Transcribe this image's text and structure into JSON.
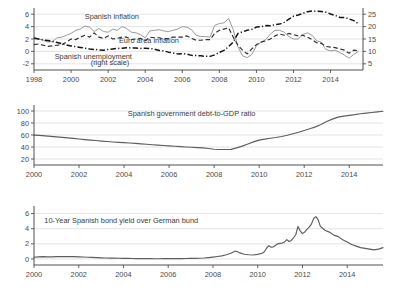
{
  "figure": {
    "title": "",
    "panel_count": 3
  },
  "chart_data": [
    {
      "id": "panel-inflation-unemployment",
      "type": "line",
      "title": "",
      "xlabel": "",
      "ylabel": "",
      "xlim": [
        1998.0,
        2015.75
      ],
      "xticks": [
        1998,
        2000,
        2002,
        2004,
        2006,
        2008,
        2010,
        2012,
        2014
      ],
      "xticklabels": [
        "1998",
        "2000",
        "2002",
        "2004",
        "2006",
        "2008",
        "2010",
        "2012",
        "2014"
      ],
      "ylim": [
        -3.0,
        7.0
      ],
      "yticks": [
        -2,
        0,
        2,
        4,
        6
      ],
      "yticklabels": [
        "-2",
        "0",
        "2",
        "4",
        "6"
      ],
      "y2lim": [
        2.5,
        27.5
      ],
      "y2ticks": [
        5,
        10,
        15,
        20,
        25
      ],
      "y2ticklabels": [
        "5",
        "10",
        "15",
        "20",
        "25"
      ],
      "grid": true,
      "legend_position": "inline-annotations",
      "annotations": [
        {
          "text": "Spanish inflation",
          "x": 2002.2,
          "y": 5.2,
          "color": "#a9a9a9"
        },
        {
          "text": "Euro area inflation",
          "x": 2004.2,
          "y": 1.35,
          "color": "#2b2b2b"
        },
        {
          "text": "Spanish unemployment",
          "x": 2001.2,
          "y": -1.25,
          "color": "#2b2b2b"
        },
        {
          "text": "(right scale)",
          "x": 2002.1,
          "y": -2.15,
          "color": "#2b2b2b"
        }
      ],
      "series": [
        {
          "name": "Spanish inflation",
          "axis": "left",
          "style": "solid-light",
          "color": "#9a9a9a",
          "x": [
            1998.0,
            1998.25,
            1998.5,
            1998.75,
            1999.0,
            1999.25,
            1999.5,
            1999.75,
            2000.0,
            2000.25,
            2000.5,
            2000.75,
            2001.0,
            2001.25,
            2001.5,
            2001.75,
            2002.0,
            2002.25,
            2002.5,
            2002.75,
            2003.0,
            2003.25,
            2003.5,
            2003.75,
            2004.0,
            2004.25,
            2004.5,
            2004.75,
            2005.0,
            2005.25,
            2005.5,
            2005.75,
            2006.0,
            2006.25,
            2006.5,
            2006.75,
            2007.0,
            2007.25,
            2007.5,
            2007.75,
            2008.0,
            2008.25,
            2008.5,
            2008.75,
            2009.0,
            2009.25,
            2009.5,
            2009.75,
            2010.0,
            2010.25,
            2010.5,
            2010.75,
            2011.0,
            2011.25,
            2011.5,
            2011.75,
            2012.0,
            2012.25,
            2012.5,
            2012.75,
            2013.0,
            2013.25,
            2013.5,
            2013.75,
            2014.0,
            2014.25,
            2014.5,
            2014.75,
            2015.0,
            2015.25,
            2015.5
          ],
          "values": [
            2.3,
            2.0,
            1.8,
            1.5,
            1.6,
            2.2,
            2.3,
            2.6,
            2.9,
            3.4,
            3.6,
            4.1,
            3.9,
            3.2,
            3.7,
            3.2,
            3.1,
            3.6,
            3.4,
            4.0,
            3.7,
            3.1,
            3.0,
            2.7,
            2.2,
            3.3,
            3.4,
            3.5,
            3.3,
            3.2,
            3.4,
            3.6,
            4.0,
            3.9,
            3.5,
            2.6,
            2.4,
            2.4,
            2.3,
            4.2,
            4.5,
            4.6,
            5.3,
            3.5,
            0.8,
            -0.7,
            -1.0,
            -0.5,
            0.9,
            1.5,
            1.9,
            2.8,
            3.4,
            3.4,
            3.1,
            2.4,
            2.0,
            2.0,
            2.7,
            3.0,
            2.6,
            1.7,
            1.5,
            0.3,
            0.1,
            0.2,
            -0.2,
            -0.6,
            -1.1,
            -0.5,
            0.0
          ]
        },
        {
          "name": "Euro area inflation",
          "axis": "left",
          "style": "dashed",
          "color": "#2f2f2f",
          "x": [
            1998.0,
            1998.25,
            1998.5,
            1998.75,
            1999.0,
            1999.25,
            1999.5,
            1999.75,
            2000.0,
            2000.25,
            2000.5,
            2000.75,
            2001.0,
            2001.25,
            2001.5,
            2001.75,
            2002.0,
            2002.25,
            2002.5,
            2002.75,
            2003.0,
            2003.25,
            2003.5,
            2003.75,
            2004.0,
            2004.25,
            2004.5,
            2004.75,
            2005.0,
            2005.25,
            2005.5,
            2005.75,
            2006.0,
            2006.25,
            2006.5,
            2006.75,
            2007.0,
            2007.25,
            2007.5,
            2007.75,
            2008.0,
            2008.25,
            2008.5,
            2008.75,
            2009.0,
            2009.25,
            2009.5,
            2009.75,
            2010.0,
            2010.25,
            2010.5,
            2010.75,
            2011.0,
            2011.25,
            2011.5,
            2011.75,
            2012.0,
            2012.25,
            2012.5,
            2012.75,
            2013.0,
            2013.25,
            2013.5,
            2013.75,
            2014.0,
            2014.25,
            2014.5,
            2014.75,
            2015.0,
            2015.25,
            2015.5
          ],
          "values": [
            1.1,
            1.2,
            1.0,
            0.8,
            0.9,
            1.0,
            1.1,
            1.5,
            2.0,
            1.9,
            2.3,
            2.6,
            2.3,
            3.0,
            2.3,
            2.1,
            2.5,
            2.0,
            2.1,
            2.3,
            2.3,
            1.9,
            2.0,
            2.1,
            1.7,
            2.3,
            2.2,
            2.2,
            2.0,
            2.1,
            2.3,
            2.3,
            2.3,
            2.5,
            2.1,
            1.8,
            1.8,
            1.9,
            1.9,
            2.9,
            3.4,
            3.6,
            3.8,
            2.3,
            1.0,
            0.2,
            -0.4,
            0.4,
            1.1,
            1.5,
            1.7,
            2.0,
            2.5,
            2.8,
            2.6,
            2.9,
            2.7,
            2.5,
            2.6,
            2.3,
            1.9,
            1.4,
            1.3,
            0.8,
            0.7,
            0.6,
            0.4,
            0.2,
            -0.3,
            0.2,
            0.1
          ]
        },
        {
          "name": "Spanish unemployment (right scale)",
          "axis": "right",
          "style": "dash-dot",
          "color": "#141414",
          "x": [
            1998.0,
            1998.25,
            1998.5,
            1998.75,
            1999.0,
            1999.25,
            1999.5,
            1999.75,
            2000.0,
            2000.25,
            2000.5,
            2000.75,
            2001.0,
            2001.25,
            2001.5,
            2001.75,
            2002.0,
            2002.25,
            2002.5,
            2002.75,
            2003.0,
            2003.25,
            2003.5,
            2003.75,
            2004.0,
            2004.25,
            2004.5,
            2004.75,
            2005.0,
            2005.25,
            2005.5,
            2005.75,
            2006.0,
            2006.25,
            2006.5,
            2006.75,
            2007.0,
            2007.25,
            2007.5,
            2007.75,
            2008.0,
            2008.25,
            2008.5,
            2008.75,
            2009.0,
            2009.25,
            2009.5,
            2009.75,
            2010.0,
            2010.25,
            2010.5,
            2010.75,
            2011.0,
            2011.25,
            2011.5,
            2011.75,
            2012.0,
            2012.25,
            2012.5,
            2012.75,
            2013.0,
            2013.25,
            2013.5,
            2013.75,
            2014.0,
            2014.25,
            2014.5,
            2014.75,
            2015.0,
            2015.25,
            2015.5
          ],
          "values": [
            15.3,
            15.0,
            14.6,
            14.4,
            14.0,
            13.6,
            13.1,
            12.6,
            12.2,
            11.9,
            11.6,
            11.3,
            11.0,
            10.8,
            10.6,
            10.5,
            10.8,
            11.0,
            11.2,
            11.3,
            11.5,
            11.4,
            11.4,
            11.2,
            11.3,
            11.2,
            10.9,
            10.4,
            10.2,
            9.7,
            9.4,
            9.0,
            9.1,
            8.9,
            8.4,
            8.3,
            8.2,
            8.0,
            8.0,
            8.6,
            9.6,
            10.4,
            11.9,
            13.8,
            17.2,
            17.9,
            18.5,
            18.9,
            19.8,
            20.0,
            20.4,
            20.3,
            20.8,
            21.0,
            21.7,
            23.0,
            24.2,
            24.7,
            25.3,
            26.0,
            26.3,
            26.2,
            26.1,
            25.8,
            25.1,
            24.5,
            23.7,
            23.7,
            23.1,
            22.4,
            21.2
          ]
        }
      ]
    },
    {
      "id": "panel-debt-to-gdp",
      "type": "line",
      "title": "Spanish government debt-to-GDP ratio",
      "xlabel": "",
      "ylabel": "",
      "xlim": [
        2000.0,
        2015.5
      ],
      "xticks": [
        2000,
        2002,
        2004,
        2006,
        2008,
        2010,
        2012,
        2014
      ],
      "xticklabels": [
        "2000",
        "2002",
        "2004",
        "2006",
        "2008",
        "2010",
        "2012",
        "2014"
      ],
      "ylim": [
        10,
        110
      ],
      "yticks": [
        20,
        40,
        60,
        80,
        100
      ],
      "yticklabels": [
        "20",
        "40",
        "60",
        "80",
        "100"
      ],
      "grid": true,
      "annotations": [
        {
          "text": "Spanish government debt-to-GDP ratio",
          "x": 2007.0,
          "y": 92,
          "color": "#a9a9a9"
        }
      ],
      "series": [
        {
          "name": "Spanish government debt-to-GDP ratio",
          "axis": "left",
          "style": "solid-dark",
          "color": "#5d5d5d",
          "x": [
            2000.0,
            2000.25,
            2000.5,
            2000.75,
            2001.0,
            2001.25,
            2001.5,
            2001.75,
            2002.0,
            2002.25,
            2002.5,
            2002.75,
            2003.0,
            2003.25,
            2003.5,
            2003.75,
            2004.0,
            2004.25,
            2004.5,
            2004.75,
            2005.0,
            2005.25,
            2005.5,
            2005.75,
            2006.0,
            2006.25,
            2006.5,
            2006.75,
            2007.0,
            2007.25,
            2007.5,
            2007.75,
            2008.0,
            2008.25,
            2008.5,
            2008.75,
            2009.0,
            2009.25,
            2009.5,
            2009.75,
            2010.0,
            2010.25,
            2010.5,
            2010.75,
            2011.0,
            2011.25,
            2011.5,
            2011.75,
            2012.0,
            2012.25,
            2012.5,
            2012.75,
            2013.0,
            2013.25,
            2013.5,
            2013.75,
            2014.0,
            2014.25,
            2014.5,
            2014.75,
            2015.0,
            2015.25,
            2015.5
          ],
          "values": [
            59.8,
            59.3,
            58.5,
            57.8,
            56.9,
            56.0,
            55.2,
            54.4,
            53.3,
            52.4,
            51.5,
            50.8,
            49.9,
            49.1,
            48.4,
            47.8,
            47.3,
            46.7,
            46.0,
            45.3,
            44.5,
            43.8,
            43.2,
            42.5,
            41.9,
            41.3,
            40.7,
            40.0,
            39.5,
            39.0,
            38.6,
            37.5,
            36.3,
            35.9,
            35.8,
            36.1,
            38.5,
            41.5,
            45.0,
            48.5,
            51.5,
            53.2,
            54.5,
            55.8,
            57.5,
            59.5,
            62.0,
            64.5,
            67.5,
            70.5,
            73.5,
            77.5,
            82.5,
            86.5,
            89.8,
            91.5,
            92.8,
            94.0,
            95.5,
            96.5,
            97.5,
            98.5,
            99.5
          ]
        }
      ]
    },
    {
      "id": "panel-bond-spread",
      "type": "line",
      "title": "10-Year Spanish bond yield over German bund",
      "xlabel": "",
      "ylabel": "",
      "xlim": [
        2000.0,
        2015.6
      ],
      "xticks": [
        2000,
        2002,
        2004,
        2006,
        2008,
        2010,
        2012,
        2014
      ],
      "xticklabels": [
        "2000",
        "2002",
        "2004",
        "2006",
        "2008",
        "2010",
        "2012",
        "2014"
      ],
      "ylim": [
        -0.8,
        7.0
      ],
      "yticks": [
        0,
        2,
        4,
        6
      ],
      "yticklabels": [
        "0",
        "2",
        "4",
        "6"
      ],
      "grid": true,
      "annotations": [
        {
          "text": "10-Year Spanish bond yield over German bund",
          "x": 2003.9,
          "y": 4.75,
          "color": "#2b2b2b"
        }
      ],
      "series": [
        {
          "name": "10-Year Spanish bond yield over German bund",
          "axis": "left",
          "style": "solid-dark",
          "color": "#5d5d5d",
          "x": [
            2000.0,
            2000.2,
            2000.4,
            2000.6,
            2000.8,
            2001.0,
            2001.2,
            2001.4,
            2001.6,
            2001.8,
            2002.0,
            2002.2,
            2002.4,
            2002.6,
            2002.8,
            2003.0,
            2003.2,
            2003.4,
            2003.6,
            2003.8,
            2004.0,
            2004.2,
            2004.4,
            2004.6,
            2004.8,
            2005.0,
            2005.2,
            2005.4,
            2005.6,
            2005.8,
            2006.0,
            2006.2,
            2006.4,
            2006.6,
            2006.8,
            2007.0,
            2007.2,
            2007.4,
            2007.6,
            2007.8,
            2008.0,
            2008.2,
            2008.4,
            2008.6,
            2008.8,
            2009.0,
            2009.1,
            2009.2,
            2009.4,
            2009.6,
            2009.8,
            2010.0,
            2010.2,
            2010.3,
            2010.4,
            2010.5,
            2010.6,
            2010.7,
            2010.8,
            2010.9,
            2011.0,
            2011.1,
            2011.2,
            2011.3,
            2011.4,
            2011.5,
            2011.6,
            2011.7,
            2011.8,
            2011.9,
            2012.0,
            2012.1,
            2012.2,
            2012.3,
            2012.4,
            2012.5,
            2012.6,
            2012.7,
            2012.8,
            2012.9,
            2013.0,
            2013.2,
            2013.4,
            2013.6,
            2013.8,
            2014.0,
            2014.2,
            2014.4,
            2014.6,
            2014.8,
            2015.0,
            2015.2,
            2015.4,
            2015.6
          ],
          "values": [
            0.22,
            0.27,
            0.3,
            0.28,
            0.27,
            0.3,
            0.31,
            0.3,
            0.32,
            0.3,
            0.28,
            0.26,
            0.22,
            0.2,
            0.18,
            0.15,
            0.12,
            0.1,
            0.1,
            0.09,
            0.08,
            0.07,
            0.06,
            0.05,
            0.05,
            0.04,
            0.04,
            0.03,
            0.03,
            0.04,
            0.05,
            0.05,
            0.05,
            0.05,
            0.06,
            0.07,
            0.08,
            0.09,
            0.12,
            0.18,
            0.25,
            0.32,
            0.4,
            0.55,
            0.75,
            1.05,
            0.95,
            0.8,
            0.62,
            0.55,
            0.52,
            0.6,
            0.75,
            0.95,
            1.45,
            1.75,
            1.55,
            1.6,
            1.8,
            2.0,
            2.05,
            2.1,
            2.25,
            2.55,
            2.3,
            2.45,
            2.8,
            3.2,
            4.3,
            3.7,
            3.35,
            3.55,
            3.9,
            4.2,
            4.6,
            5.35,
            5.6,
            5.2,
            4.3,
            4.05,
            3.8,
            3.55,
            3.15,
            2.95,
            2.55,
            2.25,
            1.9,
            1.7,
            1.5,
            1.4,
            1.3,
            1.2,
            1.3,
            1.5
          ]
        }
      ]
    }
  ]
}
